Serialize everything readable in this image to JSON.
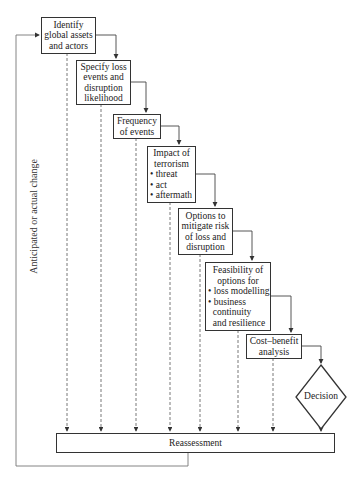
{
  "diagram": {
    "steps": [
      {
        "id": "identify",
        "lines": [
          "Identify",
          "global assets",
          "and actors"
        ]
      },
      {
        "id": "specify",
        "lines": [
          "Specify loss",
          "events and",
          "disruption",
          "likelihood"
        ]
      },
      {
        "id": "frequency",
        "lines": [
          "Frequency",
          "of events"
        ]
      },
      {
        "id": "impact",
        "title_lines": [
          "Impact of",
          "terrorism"
        ],
        "bullets": [
          "threat",
          "act",
          "aftermath"
        ]
      },
      {
        "id": "options",
        "lines": [
          "Options to",
          "mitigate risk",
          "of loss and",
          "disruption"
        ]
      },
      {
        "id": "feasibility",
        "title_lines": [
          "Feasibility of",
          "options for"
        ],
        "bullets": [
          "loss modelling",
          "business continuity and resilience"
        ],
        "bullet_lines": [
          "• loss modelling",
          "• business",
          "  continuity",
          "  and resilience"
        ]
      },
      {
        "id": "cost_benefit",
        "lines": [
          "Cost–benefit",
          "analysis"
        ]
      }
    ],
    "decision": "Decision",
    "reassessment": "Reassessment",
    "feedback_label": "Anticipated or actual change"
  }
}
